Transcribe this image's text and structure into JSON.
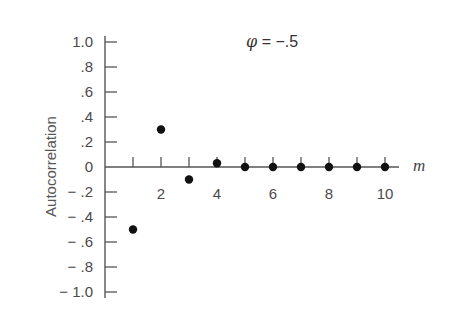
{
  "chart_data": {
    "type": "scatter",
    "title": "",
    "annotation": "φ = −.5",
    "annotation_symbol": "φ",
    "annotation_value": "= −.5",
    "xlabel": "m",
    "ylabel": "Autocorrelation",
    "x": [
      1,
      2,
      3,
      4,
      5,
      6,
      7,
      8,
      9,
      10
    ],
    "values": [
      -0.5,
      0.3,
      -0.1,
      0.03,
      0.0,
      0.0,
      0.0,
      0.0,
      0.0,
      0.0
    ],
    "xlim": [
      0,
      10.5
    ],
    "ylim": [
      -1.0,
      1.0
    ],
    "x_tick_labels": [
      "2",
      "4",
      "6",
      "8",
      "10"
    ],
    "x_tick_positions": [
      2,
      4,
      6,
      8,
      10
    ],
    "y_tick_labels": [
      "1.0",
      ".8",
      ".6",
      ".4",
      ".2",
      "0",
      "− .2",
      "− .4",
      "− .6",
      "− .8",
      "− 1.0"
    ],
    "y_tick_values": [
      1.0,
      0.8,
      0.6,
      0.4,
      0.2,
      0.0,
      -0.2,
      -0.4,
      -0.6,
      -0.8,
      -1.0
    ],
    "grid": false,
    "legend": null
  }
}
